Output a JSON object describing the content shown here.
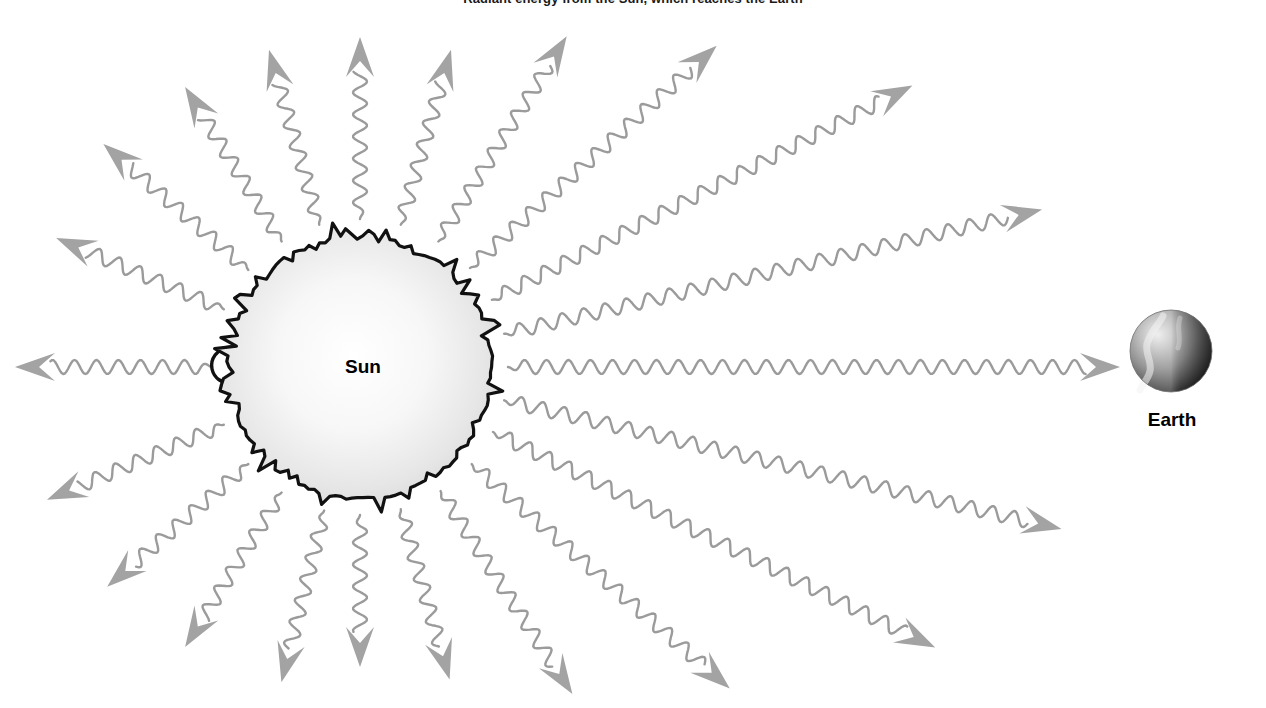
{
  "figure": {
    "caption_top": "Radiant energy from the Sun, which reaches the Earth",
    "background_color": "#ffffff"
  },
  "bodies": {
    "sun": {
      "label": "Sun",
      "center_x": 360,
      "center_y": 367,
      "radius": 132,
      "fill_center_color": "#fdfdfd",
      "fill_edge_color": "#d9d9d9",
      "outline_color": "#111111",
      "has_prominence_loop": true
    },
    "earth": {
      "label": "Earth",
      "center_x": 1171,
      "center_y": 351,
      "radius": 41,
      "light_color": "#e8e8e8",
      "mid_color": "#9a9a9a",
      "dark_color": "#2e2e2e"
    }
  },
  "rays": {
    "count": 20,
    "stroke_color": "#9b9b9b",
    "arrowhead_color": "#a3a3a3",
    "stroke_width": 2.4,
    "wave_amplitude": 7,
    "wave_length": 22,
    "description": "Wavy sinusoidal radiation rays emanating from the Sun in all directions with dart-shaped arrowheads at their outer ends; the horizontal right-pointing ray terminates at the Earth.",
    "list": [
      {
        "name": "ray-e",
        "angle_deg": 0,
        "start_r": 148,
        "end_r": 760
      },
      {
        "name": "ray-ene-1",
        "angle_deg": -13,
        "start_r": 148,
        "end_r": 700
      },
      {
        "name": "ray-ene-2",
        "angle_deg": -27,
        "start_r": 148,
        "end_r": 620
      },
      {
        "name": "ray-ne-1",
        "angle_deg": -42,
        "start_r": 148,
        "end_r": 480
      },
      {
        "name": "ray-ne-2",
        "angle_deg": -58,
        "start_r": 148,
        "end_r": 390
      },
      {
        "name": "ray-nne",
        "angle_deg": -74,
        "start_r": 148,
        "end_r": 330
      },
      {
        "name": "ray-n",
        "angle_deg": -90,
        "start_r": 148,
        "end_r": 330
      },
      {
        "name": "ray-nnw",
        "angle_deg": -106,
        "start_r": 148,
        "end_r": 330
      },
      {
        "name": "ray-nw-1",
        "angle_deg": -122,
        "start_r": 148,
        "end_r": 330
      },
      {
        "name": "ray-nw-2",
        "angle_deg": -139,
        "start_r": 148,
        "end_r": 340
      },
      {
        "name": "ray-wnw",
        "angle_deg": -157,
        "start_r": 148,
        "end_r": 330
      },
      {
        "name": "ray-w",
        "angle_deg": 180,
        "start_r": 148,
        "end_r": 345
      },
      {
        "name": "ray-wsw",
        "angle_deg": 157,
        "start_r": 148,
        "end_r": 340
      },
      {
        "name": "ray-sw-1",
        "angle_deg": 139,
        "start_r": 148,
        "end_r": 335
      },
      {
        "name": "ray-sw-2",
        "angle_deg": 122,
        "start_r": 148,
        "end_r": 330
      },
      {
        "name": "ray-ssw",
        "angle_deg": 104,
        "start_r": 148,
        "end_r": 325
      },
      {
        "name": "ray-s",
        "angle_deg": 90,
        "start_r": 148,
        "end_r": 300
      },
      {
        "name": "ray-sse",
        "angle_deg": 74,
        "start_r": 148,
        "end_r": 325
      },
      {
        "name": "ray-se-1",
        "angle_deg": 57,
        "start_r": 148,
        "end_r": 390
      },
      {
        "name": "ray-se-2",
        "angle_deg": 41,
        "start_r": 148,
        "end_r": 490
      },
      {
        "name": "ray-ese-1",
        "angle_deg": 26,
        "start_r": 148,
        "end_r": 640
      },
      {
        "name": "ray-ese-2",
        "angle_deg": 13,
        "start_r": 148,
        "end_r": 720
      }
    ]
  },
  "chart_data": {
    "type": "diagram",
    "title": "Radiant energy from the Sun, which reaches the Earth",
    "elements": [
      "Sun",
      "Earth",
      "radiation rays"
    ],
    "annotations": [
      "Sun",
      "Earth"
    ]
  }
}
